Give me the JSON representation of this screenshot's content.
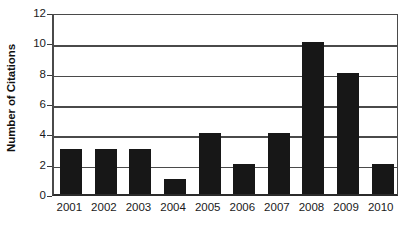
{
  "chart_data": {
    "type": "bar",
    "title": "",
    "subtitle": "",
    "xlabel": "",
    "ylabel": "Number of Citations",
    "categories": [
      "2001",
      "2002",
      "2003",
      "2004",
      "2005",
      "2006",
      "2007",
      "2008",
      "2009",
      "2010"
    ],
    "values": [
      3,
      3,
      3,
      1,
      4,
      2,
      4,
      10,
      8,
      2
    ],
    "series": [
      {
        "name": "Citations",
        "values": [
          3,
          3,
          3,
          1,
          4,
          2,
          4,
          10,
          8,
          2
        ]
      }
    ],
    "ylim": [
      0,
      12
    ],
    "ytick_labels": [
      "0",
      "2",
      "4",
      "6",
      "8",
      "10",
      "12"
    ],
    "ytick_values": [
      0,
      2,
      4,
      6,
      8,
      10,
      12
    ],
    "grid": true,
    "grid_axis": "y",
    "legend": false,
    "legend_position": "none",
    "bar_color": "#171717",
    "axis_color": "#4a4a4a",
    "background_color": "#ffffff",
    "annotations": []
  }
}
